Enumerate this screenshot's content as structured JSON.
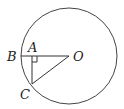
{
  "diagram": {
    "type": "geometry-circle",
    "circle": {
      "center_label": "O",
      "cx": 69,
      "cy": 56,
      "r": 48
    },
    "points": [
      {
        "label": "B",
        "x": 21,
        "y": 56,
        "label_x": 7,
        "label_y": 61
      },
      {
        "label": "A",
        "x": 32,
        "y": 56,
        "label_x": 28,
        "label_y": 52
      },
      {
        "label": "O",
        "x": 69,
        "y": 56,
        "label_x": 72,
        "label_y": 61
      },
      {
        "label": "C",
        "x": 32,
        "y": 84,
        "label_x": 20,
        "label_y": 99
      }
    ],
    "segments": [
      {
        "from": "B",
        "to": "O"
      },
      {
        "from": "A",
        "to": "C"
      },
      {
        "from": "C",
        "to": "O"
      }
    ],
    "right_angle_at": "A",
    "stroke_color": "#333333"
  }
}
